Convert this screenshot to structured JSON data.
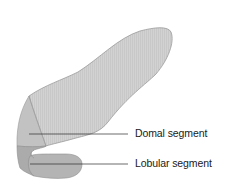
{
  "diagram": {
    "labels": [
      {
        "id": "domal",
        "text": "Domal segment"
      },
      {
        "id": "lobular",
        "text": "Lobular segment"
      }
    ],
    "colors": {
      "domal_fill": "#cfcfcf",
      "body_fill": "#d4d4d4",
      "dark_band": "#a9a9a9",
      "lobule_fill": "#b3b3b3",
      "outline": "#8f8f8f",
      "leader": "#2b2b2b"
    }
  }
}
